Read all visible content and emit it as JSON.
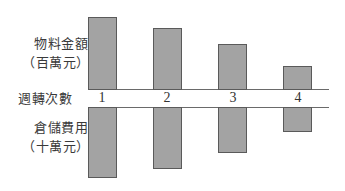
{
  "chart_data": {
    "type": "bar",
    "title": "",
    "xlabel": "週轉次數",
    "categories": [
      "1",
      "2",
      "3",
      "4"
    ],
    "series": [
      {
        "name": "物料金額（百萬元）",
        "direction": "up",
        "values": [
          73,
          62,
          46,
          24
        ]
      },
      {
        "name": "倉儲費用（十萬元）",
        "direction": "down",
        "values": [
          71,
          62,
          46,
          25
        ]
      }
    ],
    "ylim": [
      0,
      80
    ],
    "grid": false,
    "legend": "none",
    "note": "Values are relative bar heights in pixels; no numeric axis shown"
  },
  "labels": {
    "top_series_line1": "物料金額",
    "top_series_line2": "（百萬元）",
    "axis": "週轉次數",
    "bottom_series_line1": "倉儲費用",
    "bottom_series_line2": "（十萬元）"
  },
  "ticks": [
    "1",
    "2",
    "3",
    "4"
  ],
  "colors": {
    "bar_fill": "#a3a3a3",
    "bar_border": "#5a5a5a",
    "axis_line": "#6a6a6a"
  }
}
